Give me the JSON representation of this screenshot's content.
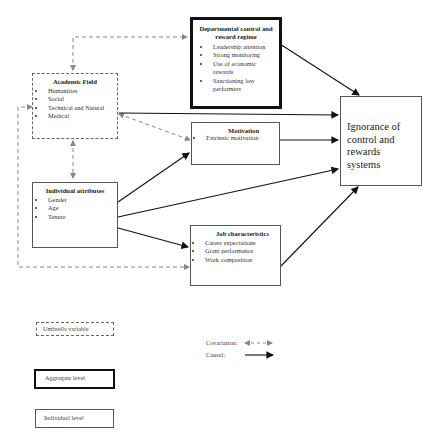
{
  "diagram": {
    "nodes": {
      "departmental": {
        "title": "Departmental control and reward regime",
        "items": [
          "Leadership attention",
          "Strong monitoring",
          "Use of economic rewards",
          "Sanctioning low performers"
        ],
        "style": "aggregate"
      },
      "academic_field": {
        "title": "Academic Field",
        "items": [
          "Humanities",
          "Social",
          "Technical and Natural",
          "Medical"
        ],
        "style": "umbrella"
      },
      "motivation": {
        "title": "Motivation",
        "items": [
          "Extrinsic motivation"
        ],
        "style": "individual"
      },
      "individual_attributes": {
        "title": "Individual attributes",
        "items": [
          "Gender",
          "Age",
          "Tenure"
        ],
        "style": "individual"
      },
      "job_characteristics": {
        "title": "Job characteristics",
        "items": [
          "Career expectations",
          "Grant performance",
          "Work composition"
        ],
        "style": "individual"
      },
      "outcome": {
        "title": "Ignorance of control and rewards systems",
        "style": "individual"
      }
    },
    "edges": [
      {
        "from": "academic_field",
        "to": "departmental",
        "type": "covariation"
      },
      {
        "from": "academic_field",
        "to": "motivation",
        "type": "covariation"
      },
      {
        "from": "academic_field",
        "to": "individual_attributes",
        "type": "covariation"
      },
      {
        "from": "academic_field",
        "to": "job_characteristics",
        "type": "covariation"
      },
      {
        "from": "departmental",
        "to": "outcome",
        "type": "causal"
      },
      {
        "from": "academic_field",
        "to": "outcome",
        "type": "causal"
      },
      {
        "from": "motivation",
        "to": "outcome",
        "type": "causal"
      },
      {
        "from": "individual_attributes",
        "to": "outcome",
        "type": "causal"
      },
      {
        "from": "individual_attributes",
        "to": "motivation",
        "type": "causal"
      },
      {
        "from": "individual_attributes",
        "to": "job_characteristics",
        "type": "causal"
      },
      {
        "from": "job_characteristics",
        "to": "outcome",
        "type": "causal"
      }
    ]
  },
  "legend": {
    "umbrella": "Umbrella variable",
    "aggregate": "Aggregate level",
    "individual": "Individual level",
    "covariation": "Covariation:",
    "causal": "Causal:"
  }
}
